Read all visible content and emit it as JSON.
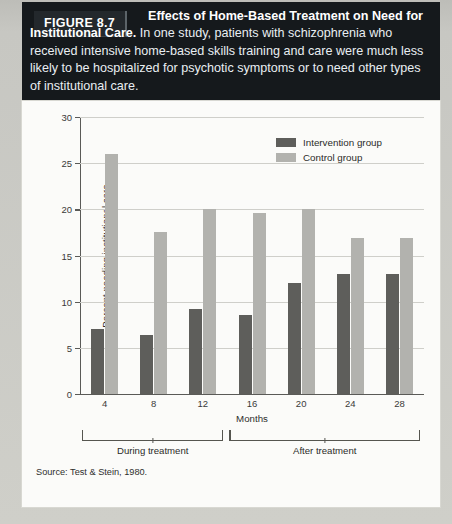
{
  "caption": {
    "figure_label": "FIGURE 8.7",
    "headline": "Effects of Home-Based Treatment on Need for Institutional Care.",
    "body": " In one study, patients with schizophrenia who received intensive home-based skills training and care were much less likely to be hospitalized for psychotic symptoms or to need other types of institutional care."
  },
  "source": "Source: Test & Stein, 1980.",
  "groups": {
    "during": "During treatment",
    "after": "After treatment"
  },
  "legend": {
    "intervention": "Intervention group",
    "control": "Control group"
  },
  "colors": {
    "intervention": "#5e5e5b",
    "control": "#b2b2ae",
    "caption_bg": "#15191c",
    "card_bg": "#fbfbf9",
    "page_bg": "#c9c9c4"
  },
  "chart_data": {
    "type": "bar",
    "title": "",
    "xlabel": "Months",
    "ylabel": "Percent needing institutional care",
    "categories": [
      "4",
      "8",
      "12",
      "16",
      "20",
      "24",
      "28"
    ],
    "yticks": [
      0,
      5,
      10,
      15,
      20,
      25,
      30
    ],
    "ylim": [
      0,
      30
    ],
    "grid": true,
    "legend_position": "top-right",
    "series": [
      {
        "name": "Intervention group",
        "color": "#5e5e5b",
        "values": [
          7.0,
          6.3,
          9.2,
          8.5,
          12.0,
          13.0,
          13.0
        ]
      },
      {
        "name": "Control group",
        "color": "#b2b2ae",
        "values": [
          26.0,
          17.5,
          20.0,
          19.6,
          20.0,
          16.9,
          16.9
        ]
      }
    ]
  }
}
